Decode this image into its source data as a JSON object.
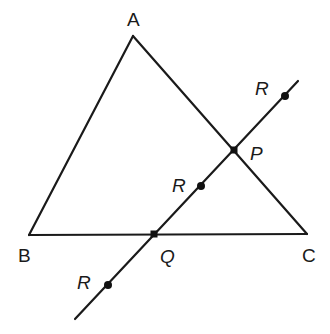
{
  "diagram": {
    "type": "geometry",
    "colors": {
      "stroke": "#1a1a1a",
      "point": "#111111",
      "background": "#ffffff"
    },
    "vertices": {
      "A": {
        "label": "A",
        "x": 133,
        "y": 36,
        "label_x": 133,
        "label_y": 26
      },
      "B": {
        "label": "B",
        "x": 29,
        "y": 235,
        "label_x": 25,
        "label_y": 262
      },
      "C": {
        "label": "C",
        "x": 307,
        "y": 234,
        "label_x": 308,
        "label_y": 262
      }
    },
    "line": {
      "x1": 298,
      "y1": 81,
      "x2": 75,
      "y2": 319
    },
    "intersections": {
      "P": {
        "label": "P",
        "x": 234,
        "y": 150,
        "label_x": 257,
        "label_y": 160
      },
      "Q": {
        "label": "Q",
        "x": 154,
        "y": 234,
        "label_x": 167,
        "label_y": 263
      }
    },
    "r_points": [
      {
        "label": "R",
        "x": 285,
        "y": 96,
        "label_x": 262,
        "label_y": 95
      },
      {
        "label": "R",
        "x": 201,
        "y": 186,
        "label_x": 179,
        "label_y": 192
      },
      {
        "label": "R",
        "x": 108,
        "y": 285,
        "label_x": 84,
        "label_y": 289
      }
    ]
  }
}
